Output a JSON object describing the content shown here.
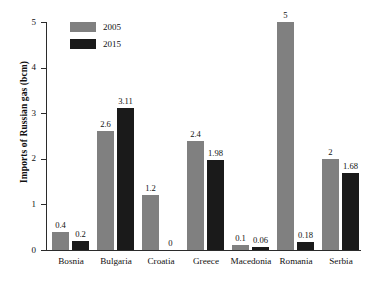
{
  "chart_data": {
    "type": "bar",
    "title": "",
    "xlabel": "",
    "ylabel": "Imports of Russian gas (bcm)",
    "ylim": [
      0,
      5
    ],
    "yticks": [
      "0",
      "1",
      "2",
      "3",
      "4",
      "5"
    ],
    "grid": false,
    "legend_position": "top-left",
    "categories": [
      "Bosnia",
      "Bulgaria",
      "Croatia",
      "Greece",
      "Macedonia",
      "Romania",
      "Serbia"
    ],
    "series": [
      {
        "name": "2005",
        "color": "#808080",
        "values": [
          0.4,
          2.6,
          1.2,
          2.4,
          0.1,
          5,
          2
        ],
        "labels": [
          "0.4",
          "2.6",
          "1.2",
          "2.4",
          "0.1",
          "5",
          "2"
        ]
      },
      {
        "name": "2015",
        "color": "#1a1a1a",
        "values": [
          0.2,
          3.11,
          0,
          1.98,
          0.06,
          0.18,
          1.68
        ],
        "labels": [
          "0.2",
          "3.11",
          "0",
          "1.98",
          "0.06",
          "0.18",
          "1.68"
        ]
      }
    ]
  },
  "legend": {
    "items": [
      {
        "label": "2005",
        "swatch": "#808080"
      },
      {
        "label": "2015",
        "swatch": "#1a1a1a"
      }
    ]
  }
}
